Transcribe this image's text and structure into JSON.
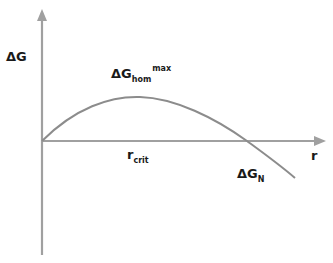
{
  "diagram": {
    "y_axis_label": "ΔG",
    "x_axis_label": "r",
    "peak_label": {
      "main": "ΔG",
      "sub": "hom",
      "sup": "max"
    },
    "rcrit_label": {
      "main": "r",
      "sub": "crit"
    },
    "dgn_label": {
      "main": "ΔG",
      "sub": "N"
    },
    "colors": {
      "axis": "#9a9a9a",
      "curve": "#8c8c8c",
      "text": "#1a1a1a"
    }
  }
}
